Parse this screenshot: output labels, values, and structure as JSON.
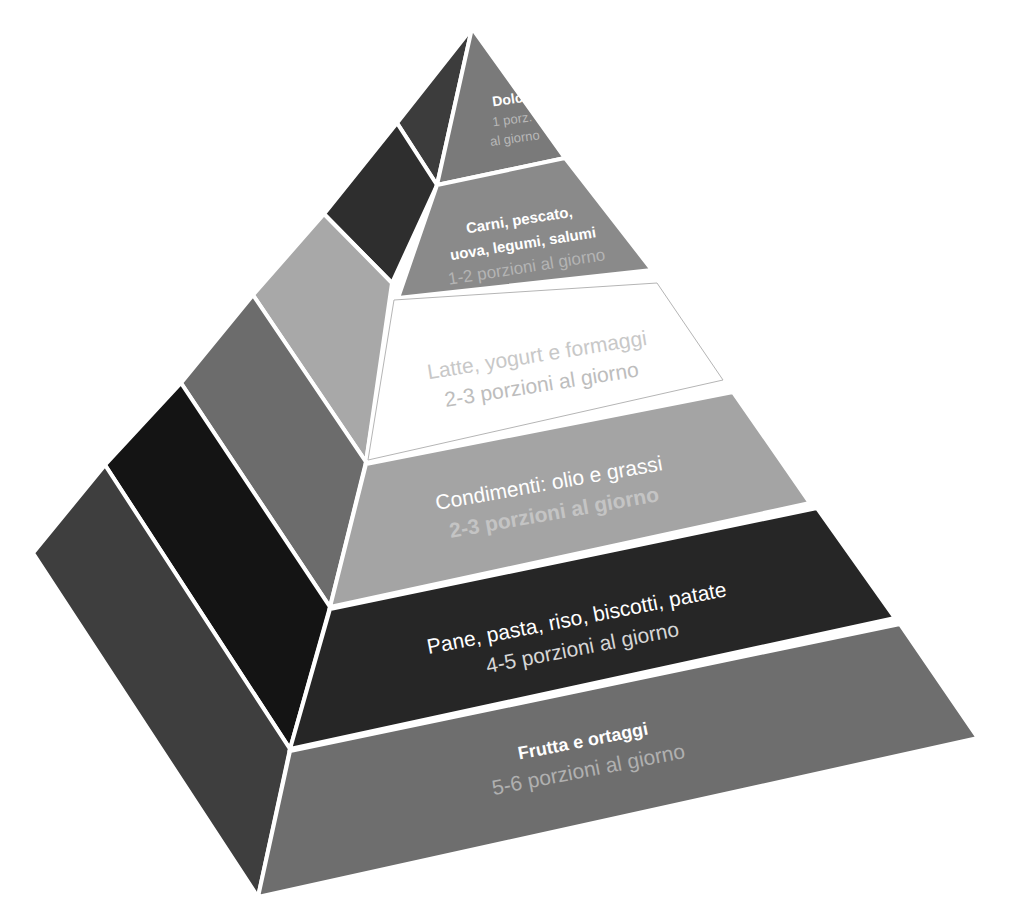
{
  "diagram": {
    "title": "",
    "type": "food-pyramid",
    "colors": {
      "background": "#ffffff",
      "separator": "#ffffff"
    },
    "levels": [
      {
        "id": "dolci",
        "title": "Dolci",
        "subtitle_line1": "1 porz.",
        "subtitle_line2": "al giorno",
        "front_color": "#7a7a7a",
        "side_color": "#3c3c3c",
        "title_color": "#ffffff",
        "subtitle_color": "#b8b8b8"
      },
      {
        "id": "carni",
        "title_line1": "Carni, pescato,",
        "title_line2": "uova, legumi, salumi",
        "subtitle": "1-2 porzioni al giorno",
        "front_color": "#8a8a8a",
        "side_color": "#2e2e2e",
        "title_color": "#ffffff",
        "subtitle_color": "#b4b4b4"
      },
      {
        "id": "latte",
        "title": "Latte, yogurt e formaggi",
        "subtitle": "2-3 porzioni al giorno",
        "front_color": "#ffffff",
        "side_color": "#a8a8a8",
        "title_color": "#c8c8c8",
        "subtitle_color": "#bdbdbd"
      },
      {
        "id": "condimenti",
        "title": "Condimenti: olio e grassi",
        "subtitle": "2-3 porzioni al giorno",
        "front_color": "#a4a4a4",
        "side_color": "#6c6c6c",
        "title_color": "#ffffff",
        "subtitle_color": "#c4c4c4"
      },
      {
        "id": "pane",
        "title": "Pane, pasta, riso, biscotti, patate",
        "subtitle": "4-5 porzioni al giorno",
        "front_color": "#262626",
        "side_color": "#141414",
        "title_color": "#ffffff",
        "subtitle_color": "#d6d6d6"
      },
      {
        "id": "frutta",
        "title": "Frutta e ortaggi",
        "subtitle": "5-6 porzioni al giorno",
        "front_color": "#6e6e6e",
        "side_color": "#3e3e3e",
        "title_color": "#ffffff",
        "subtitle_color": "#b0b0b0"
      }
    ]
  }
}
